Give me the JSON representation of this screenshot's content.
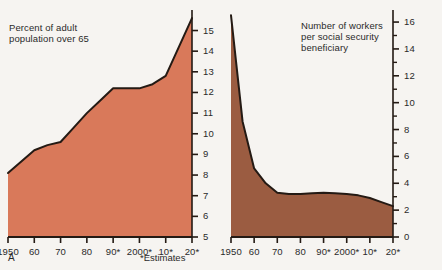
{
  "figure": {
    "background_color": "#f6f4f1",
    "text_color": "#2a2a2a"
  },
  "panels": {
    "a": {
      "letter": "A",
      "caption": "Percent of adult\npopulation over 65",
      "estimates_note": "*Estimates"
    },
    "b": {
      "letter": "B",
      "caption": "Number of workers\nper social security\nbeneficiary",
      "estimates_note": "*Estimates"
    }
  },
  "chart_data": [
    {
      "id": "panel-a",
      "type": "area",
      "title": "Percent of adult population over 65",
      "xlabel": "",
      "ylabel": "",
      "fill_color": "#d9795a",
      "line_color": "#241a14",
      "grid": false,
      "legend": "none",
      "xlim": [
        1950,
        2020
      ],
      "ylim": [
        5,
        15.8
      ],
      "x": [
        1950,
        1960,
        1965,
        1970,
        1975,
        1980,
        1985,
        1990,
        2000,
        2005,
        2010,
        2020
      ],
      "values": [
        8.1,
        9.2,
        9.45,
        9.6,
        10.3,
        11.0,
        11.6,
        12.2,
        12.2,
        12.4,
        12.8,
        15.6
      ],
      "x_tick_labels": [
        "1950",
        "60",
        "70",
        "80",
        "90*",
        "2000*",
        "10*",
        "20*"
      ],
      "x_tick_values": [
        1950,
        1960,
        1970,
        1980,
        1990,
        2000,
        2010,
        2020
      ],
      "y_tick_labels": [
        "5",
        "6",
        "7",
        "8",
        "9",
        "10",
        "11",
        "12",
        "13",
        "14",
        "15"
      ],
      "y_tick_values": [
        5,
        6,
        7,
        8,
        9,
        10,
        11,
        12,
        13,
        14,
        15
      ],
      "y_minor_ticks": []
    },
    {
      "id": "panel-b",
      "type": "area",
      "title": "Number of workers per social security beneficiary",
      "xlabel": "",
      "ylabel": "",
      "fill_color": "#9b5c41",
      "line_color": "#241a14",
      "grid": false,
      "legend": "none",
      "xlim": [
        1950,
        2020
      ],
      "ylim": [
        0,
        16.6
      ],
      "x": [
        1950,
        1955,
        1960,
        1965,
        1970,
        1975,
        1980,
        1985,
        1990,
        1995,
        2000,
        2005,
        2010,
        2015,
        2020
      ],
      "values": [
        16.5,
        8.6,
        5.1,
        4.0,
        3.3,
        3.2,
        3.2,
        3.25,
        3.3,
        3.25,
        3.2,
        3.1,
        2.9,
        2.6,
        2.3
      ],
      "x_tick_labels": [
        "1950",
        "60",
        "70",
        "80",
        "90*",
        "2000*",
        "10*",
        "20*"
      ],
      "x_tick_values": [
        1950,
        1960,
        1970,
        1980,
        1990,
        2000,
        2010,
        2020
      ],
      "y_tick_labels": [
        "0",
        "2",
        "4",
        "6",
        "8",
        "10",
        "12",
        "14",
        "16"
      ],
      "y_tick_values": [
        0,
        2,
        4,
        6,
        8,
        10,
        12,
        14,
        16
      ],
      "y_minor_ticks": [
        1,
        3,
        5,
        7,
        9,
        11,
        13,
        15
      ]
    }
  ]
}
